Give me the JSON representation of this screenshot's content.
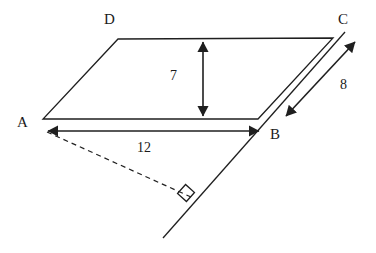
{
  "figure": {
    "kind": "parallelogram-with-height-and-slant",
    "stroke_color": "#1f1f1f",
    "background_color": "#ffffff",
    "vertices": [
      {
        "name": "A",
        "label": "A",
        "x": 43,
        "y": 119
      },
      {
        "name": "B",
        "label": "B",
        "x": 258,
        "y": 119
      },
      {
        "name": "C",
        "label": "C",
        "x": 333,
        "y": 38
      },
      {
        "name": "D",
        "label": "D",
        "x": 118,
        "y": 39
      }
    ],
    "measures": [
      {
        "name": "height",
        "label": "7",
        "orientation": "vertical",
        "x": 203,
        "y1": 40,
        "y2": 118
      },
      {
        "name": "base-AB",
        "label": "12",
        "orientation": "horizontal",
        "y": 131,
        "x1": 45,
        "x2": 262
      },
      {
        "name": "side-BC",
        "label": "8",
        "orientation": "diagonal",
        "x1": 285,
        "y1": 117,
        "x2": 356,
        "y2": 41
      }
    ],
    "extended_line": {
      "name": "line-through-B-extended",
      "x1": 163,
      "y1": 238,
      "x2": 345,
      "y2": 32
    },
    "perpendicular_drop": {
      "name": "dashed-perpendicular-from-A",
      "x1": 47,
      "y1": 132,
      "x2": 191,
      "y2": 197,
      "dash": "5 4"
    },
    "right_angle_marker": {
      "name": "right-angle-square",
      "cx": 186,
      "cy": 193,
      "size": 12,
      "rotation_deg": -48
    }
  }
}
